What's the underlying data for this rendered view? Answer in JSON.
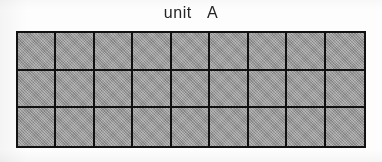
{
  "figure": {
    "title": "unit  A",
    "name": "unit-a-grid-figure",
    "background_color": "#fdfdfd",
    "line_color": "#111111",
    "cell_fill_color": "#9c9c9c",
    "title_color": "#242424"
  },
  "grid": {
    "columns": 9,
    "rows": 3,
    "total_cells": 27,
    "cells": [
      [
        "",
        "",
        "",
        "",
        "",
        "",
        "",
        "",
        ""
      ],
      [
        "",
        "",
        "",
        "",
        "",
        "",
        "",
        "",
        ""
      ],
      [
        "",
        "",
        "",
        "",
        "",
        "",
        "",
        "",
        ""
      ]
    ]
  },
  "chart_data": {
    "type": "heatmap",
    "title": "unit  A",
    "xlabel": "",
    "ylabel": "",
    "columns": 9,
    "rows": 3,
    "values": [
      [
        1,
        1,
        1,
        1,
        1,
        1,
        1,
        1,
        1
      ],
      [
        1,
        1,
        1,
        1,
        1,
        1,
        1,
        1,
        1
      ],
      [
        1,
        1,
        1,
        1,
        1,
        1,
        1,
        1,
        1
      ]
    ],
    "grid": true,
    "legend": "none",
    "fill_color": "#9c9c9c",
    "line_color": "#111111"
  }
}
